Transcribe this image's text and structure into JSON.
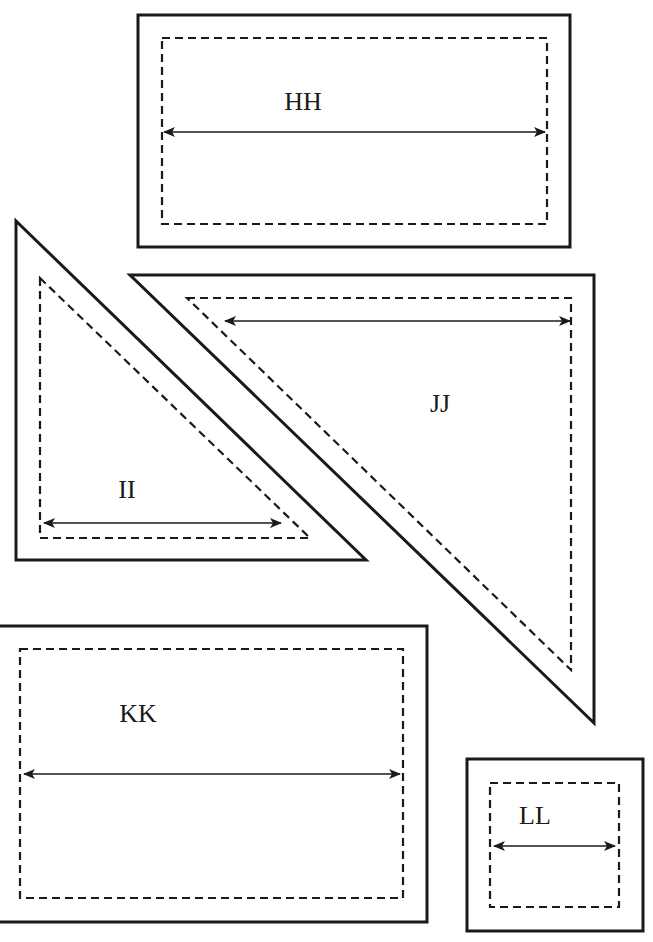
{
  "diagram": {
    "type": "quilt-pattern-templates",
    "legend": {
      "solid_line": "cutting line",
      "dashed_line": "seam line",
      "double_arrow": "dimension reference"
    },
    "pieces": [
      {
        "id": "HH",
        "label": "HH",
        "shape": "rectangle"
      },
      {
        "id": "II",
        "label": "II",
        "shape": "right-triangle"
      },
      {
        "id": "JJ",
        "label": "JJ",
        "shape": "right-triangle"
      },
      {
        "id": "KK",
        "label": "KK",
        "shape": "rectangle"
      },
      {
        "id": "LL",
        "label": "LL",
        "shape": "square"
      }
    ],
    "colors": {
      "stroke": "#1a1a1a",
      "background": "#ffffff"
    }
  }
}
